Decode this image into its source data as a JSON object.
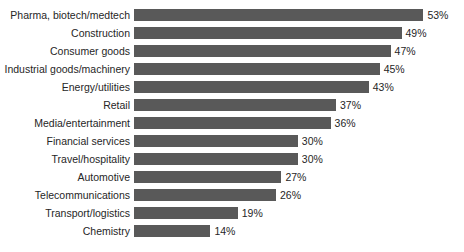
{
  "chart_data": {
    "type": "bar",
    "orientation": "horizontal",
    "title": "",
    "subtitle": "",
    "xlabel": "",
    "ylabel": "",
    "xlim": [
      0,
      53
    ],
    "grid": false,
    "legend": null,
    "value_suffix": "%",
    "categories": [
      "Pharma, biotech/medtech",
      "Construction",
      "Consumer goods",
      "Industrial goods/machinery",
      "Energy/utilities",
      "Retail",
      "Media/entertainment",
      "Financial services",
      "Travel/hospitality",
      "Automotive",
      "Telecommunications",
      "Transport/logistics",
      "Chemistry"
    ],
    "values": [
      53,
      49,
      47,
      45,
      43,
      37,
      36,
      30,
      30,
      27,
      26,
      19,
      14
    ],
    "value_labels": [
      "53%",
      "49%",
      "47%",
      "45%",
      "43%",
      "37%",
      "36%",
      "30%",
      "30%",
      "27%",
      "26%",
      "19%",
      "14%"
    ]
  },
  "colors": {
    "bar": "#595959",
    "background": "#ffffff",
    "text": "#262626"
  },
  "layout": {
    "bar_origin_x": 134,
    "px_per_unit": 5.46,
    "row_pitch": 18,
    "first_row_top": 6,
    "bar_height": 12,
    "value_gap": 4
  }
}
